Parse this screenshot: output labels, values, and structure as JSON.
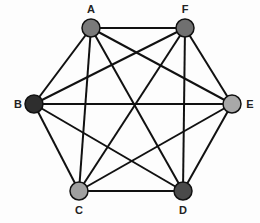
{
  "graph": {
    "type": "complete-graph-K6",
    "nodes": [
      {
        "id": "A",
        "label": "A",
        "x": 91,
        "y": 28,
        "fill": "#7a7a7a",
        "lx": 91,
        "ly": 13
      },
      {
        "id": "F",
        "label": "F",
        "x": 185,
        "y": 28,
        "fill": "#707070",
        "lx": 185,
        "ly": 13
      },
      {
        "id": "B",
        "label": "B",
        "x": 34,
        "y": 104,
        "fill": "#2e2e2e",
        "lx": 18,
        "ly": 108
      },
      {
        "id": "E",
        "label": "E",
        "x": 232,
        "y": 104,
        "fill": "#a8a8a8",
        "lx": 250,
        "ly": 108
      },
      {
        "id": "C",
        "label": "C",
        "x": 79,
        "y": 191,
        "fill": "#a0a0a0",
        "lx": 79,
        "ly": 214
      },
      {
        "id": "D",
        "label": "D",
        "x": 183,
        "y": 191,
        "fill": "#4a4a4a",
        "lx": 183,
        "ly": 214
      }
    ],
    "edges": [
      [
        "A",
        "F"
      ],
      [
        "A",
        "B"
      ],
      [
        "A",
        "E"
      ],
      [
        "A",
        "C"
      ],
      [
        "A",
        "D"
      ],
      [
        "F",
        "B"
      ],
      [
        "F",
        "E"
      ],
      [
        "F",
        "C"
      ],
      [
        "F",
        "D"
      ],
      [
        "B",
        "E"
      ],
      [
        "B",
        "C"
      ],
      [
        "B",
        "D"
      ],
      [
        "E",
        "C"
      ],
      [
        "E",
        "D"
      ],
      [
        "C",
        "D"
      ]
    ]
  }
}
